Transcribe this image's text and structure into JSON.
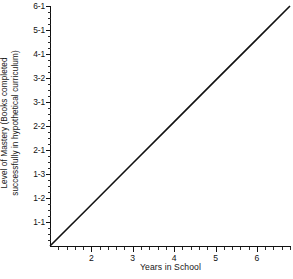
{
  "chart_data": {
    "type": "line",
    "title": "",
    "xlabel": "Years in School",
    "ylabel": "Level of Mastery (Books completed\nsuccessfully in hypothetical curriculum)",
    "grid": false,
    "legend": null,
    "xlim": [
      1,
      6.8
    ],
    "ylim": [
      0,
      10
    ],
    "x_tick_labels": [
      "2",
      "3",
      "4",
      "5",
      "6"
    ],
    "x_tick_values": [
      2,
      3,
      4,
      5,
      6
    ],
    "x_minor_ticks_between": 4,
    "y_tick_labels": [
      "1-1",
      "1-2",
      "1-3",
      "2-1",
      "2-2",
      "3-1",
      "3-2",
      "4-1",
      "5-1",
      "6-1"
    ],
    "y_tick_index": [
      1,
      2,
      3,
      4,
      5,
      6,
      7,
      8,
      9,
      10
    ],
    "y_minor_ticks_between": 3,
    "series": [
      {
        "name": "Level of Mastery",
        "x": [
          1.0,
          6.8
        ],
        "y": [
          0.0,
          10.0
        ],
        "points": [
          {
            "x": 1.0,
            "y": 0.0,
            "y_label": ""
          },
          {
            "x": 2.0,
            "y": 1.72,
            "y_label": "1-2"
          },
          {
            "x": 3.0,
            "y": 3.45,
            "y_label": "2-1"
          },
          {
            "x": 4.0,
            "y": 5.17,
            "y_label": "2-2"
          },
          {
            "x": 5.0,
            "y": 6.9,
            "y_label": "3-2"
          },
          {
            "x": 6.0,
            "y": 8.62,
            "y_label": "4-1"
          },
          {
            "x": 6.8,
            "y": 10.0,
            "y_label": "6-1"
          }
        ],
        "color": "#111111",
        "linewidth": 1.6
      }
    ]
  },
  "axis": {
    "line_color": "#111111"
  }
}
